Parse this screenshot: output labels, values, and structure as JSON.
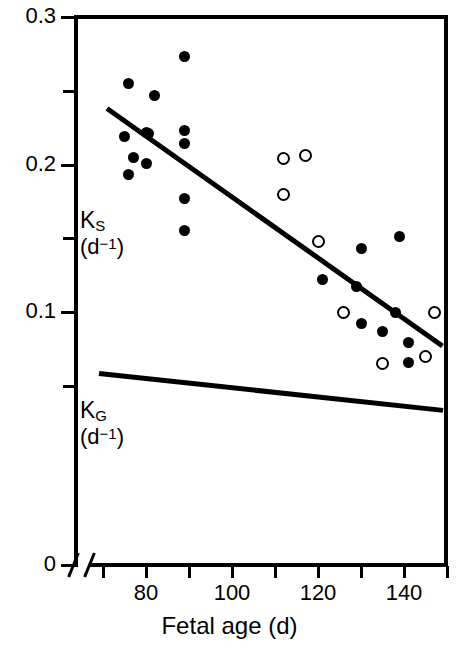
{
  "figure": {
    "background": "#ffffff",
    "ink_color": "#000000"
  },
  "chart_data": {
    "type": "scatter",
    "title": "",
    "xlabel": "Fetal age (d)",
    "ylabel": "",
    "xlim": [
      66,
      154
    ],
    "ylim": [
      0,
      0.3
    ],
    "grid": false,
    "legend": "none",
    "axis_break": {
      "axis": "x",
      "note": "break between 0 and start of scale"
    },
    "x_ticks": [
      {
        "value": 70,
        "label": ""
      },
      {
        "value": 80,
        "label": "80"
      },
      {
        "value": 90,
        "label": ""
      },
      {
        "value": 100,
        "label": "100"
      },
      {
        "value": 110,
        "label": ""
      },
      {
        "value": 120,
        "label": "120"
      },
      {
        "value": 130,
        "label": ""
      },
      {
        "value": 140,
        "label": "140"
      },
      {
        "value": 150,
        "label": ""
      }
    ],
    "y_ticks": [
      {
        "value": 0.3,
        "label": "0.3"
      },
      {
        "value": 0.25,
        "label": ""
      },
      {
        "value": 0.2,
        "label": "0.2"
      },
      {
        "value": 0.15,
        "label": ""
      },
      {
        "value": 0.1,
        "label": "0.1"
      },
      {
        "value": 0.05,
        "label": ""
      },
      {
        "value": 0.0,
        "label": "0"
      }
    ],
    "annotations": [
      {
        "id": "ks-label",
        "line1": "K",
        "sub1": "S",
        "line2": "(d",
        "sup2": "−1",
        "line2b": ")",
        "text": "K_S (d^-1)",
        "x_px": 80,
        "y_px": 208
      },
      {
        "id": "kg-label",
        "line1": "K",
        "sub1": "G",
        "line2": "(d",
        "sup2": "−1",
        "line2b": ")",
        "text": "K_G (d^-1)",
        "x_px": 80,
        "y_px": 398
      }
    ],
    "series": [
      {
        "name": "Ks filled circles",
        "marker": "filled-circle",
        "points": [
          {
            "x": 89,
            "y": 0.273
          },
          {
            "x": 76,
            "y": 0.255
          },
          {
            "x": 82,
            "y": 0.247
          },
          {
            "x": 75,
            "y": 0.219
          },
          {
            "x": 80,
            "y": 0.222
          },
          {
            "x": 80.5,
            "y": 0.221
          },
          {
            "x": 89,
            "y": 0.223
          },
          {
            "x": 89,
            "y": 0.214
          },
          {
            "x": 77,
            "y": 0.205
          },
          {
            "x": 80,
            "y": 0.201
          },
          {
            "x": 76,
            "y": 0.193
          },
          {
            "x": 89,
            "y": 0.177
          },
          {
            "x": 89,
            "y": 0.155
          },
          {
            "x": 139,
            "y": 0.151
          },
          {
            "x": 130,
            "y": 0.143
          },
          {
            "x": 121,
            "y": 0.122
          },
          {
            "x": 129,
            "y": 0.117
          },
          {
            "x": 130,
            "y": 0.092
          },
          {
            "x": 135,
            "y": 0.087
          },
          {
            "x": 138,
            "y": 0.1
          },
          {
            "x": 141,
            "y": 0.079
          },
          {
            "x": 141,
            "y": 0.066
          }
        ]
      },
      {
        "name": "Kg open circles",
        "marker": "open-circle",
        "points": [
          {
            "x": 112,
            "y": 0.204
          },
          {
            "x": 117,
            "y": 0.206
          },
          {
            "x": 112,
            "y": 0.18
          },
          {
            "x": 120,
            "y": 0.148
          },
          {
            "x": 126,
            "y": 0.1
          },
          {
            "x": 147,
            "y": 0.1
          },
          {
            "x": 135,
            "y": 0.065
          },
          {
            "x": 145,
            "y": 0.07
          }
        ]
      }
    ],
    "fit_lines": [
      {
        "name": "Ks regression",
        "x1": 71,
        "y1": 0.238,
        "x2": 149,
        "y2": 0.077
      },
      {
        "name": "Kg regression",
        "x1": 69,
        "y1": 0.058,
        "x2": 149,
        "y2": 0.033
      }
    ]
  },
  "axis": {
    "x_title": "Fetal age (d)"
  }
}
